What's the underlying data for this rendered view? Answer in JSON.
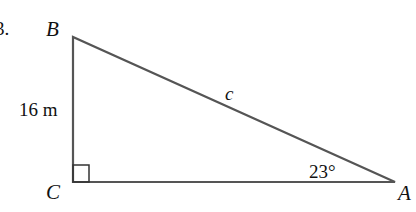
{
  "problem": {
    "number_label": "3."
  },
  "triangle": {
    "vertices": {
      "A": {
        "label": "A",
        "x": 395,
        "y": 182
      },
      "B": {
        "label": "B",
        "x": 73,
        "y": 37
      },
      "C": {
        "label": "C",
        "x": 73,
        "y": 182
      }
    },
    "right_angle_at": "C",
    "sides": {
      "BC": {
        "label": "16 m"
      },
      "AB": {
        "label": "c"
      }
    },
    "angle_A": {
      "label": "23°"
    },
    "stroke_color": "#555555"
  }
}
